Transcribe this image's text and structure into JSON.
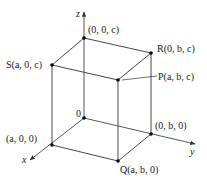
{
  "diagram": {
    "axes": {
      "x": {
        "label": "x"
      },
      "y": {
        "label": "y"
      },
      "z": {
        "label": "z"
      }
    },
    "origin_label": "0",
    "points": [
      {
        "id": "top_origin",
        "label": "(0, 0, c)"
      },
      {
        "id": "S",
        "label": "S(a, 0, c)"
      },
      {
        "id": "R",
        "label": "R(0, b, c)"
      },
      {
        "id": "P",
        "label": "P(a, b, c)"
      },
      {
        "id": "a00",
        "label": "(a, 0, 0)"
      },
      {
        "id": "0b0",
        "label": "(0, b, 0)"
      },
      {
        "id": "Q",
        "label": "Q(a, b, 0)"
      }
    ],
    "colors": {
      "line": "#333333",
      "axis": "#444444",
      "point": "#000000",
      "text": "#222222"
    }
  }
}
